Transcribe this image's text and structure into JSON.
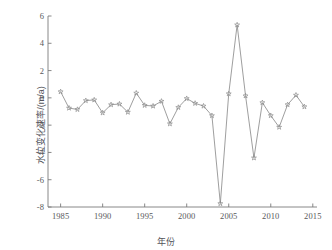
{
  "chart_data": {
    "type": "line",
    "title": "",
    "xlabel": "年份",
    "ylabel": "水位变化速率/(m/a)",
    "xlim": [
      1983.5,
      2015.5
    ],
    "ylim": [
      -8,
      6
    ],
    "xticks": [
      1985,
      1990,
      1995,
      2000,
      2005,
      2010,
      2015
    ],
    "yticks": [
      6,
      4,
      2,
      0,
      -2,
      -4,
      -6,
      -8
    ],
    "grid": false,
    "legend": null,
    "marker": "star",
    "line_color": "#8c8c8c",
    "marker_color": "#8c8c8c",
    "axis_color": "#7a7a7a",
    "series": [
      {
        "name": "水位变化速率",
        "x": [
          1985,
          1986,
          1987,
          1988,
          1989,
          1990,
          1991,
          1992,
          1993,
          1994,
          1995,
          1996,
          1997,
          1998,
          1999,
          2000,
          2001,
          2002,
          2003,
          2004,
          2005,
          2006,
          2007,
          2008,
          2009,
          2010,
          2011,
          2012,
          2013,
          2014
        ],
        "values": [
          0.45,
          -0.75,
          -0.85,
          -0.2,
          -0.15,
          -1.1,
          -0.5,
          -0.45,
          -1.05,
          0.35,
          -0.55,
          -0.6,
          -0.25,
          -1.9,
          -0.7,
          -0.05,
          -0.4,
          -0.6,
          -1.3,
          -7.75,
          0.3,
          5.35,
          0.15,
          -4.4,
          -0.35,
          -1.3,
          -2.15,
          -0.5,
          0.2,
          -0.65
        ]
      }
    ]
  },
  "axis": {
    "x_tick_labels": [
      "1985",
      "1990",
      "1995",
      "2000",
      "2005",
      "2010",
      "2015"
    ],
    "y_tick_labels": [
      "6",
      "4",
      "2",
      "0",
      "-2",
      "-4",
      "-6",
      "-8"
    ],
    "x_title": "年份",
    "y_title": "水位变化速率/(m/a)"
  }
}
